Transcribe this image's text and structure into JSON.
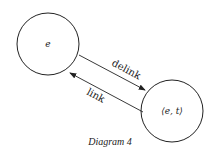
{
  "diagram": {
    "nodes": [
      {
        "id": "e",
        "label": "e"
      },
      {
        "id": "et",
        "label": "⟨e, t⟩"
      }
    ],
    "edges": [
      {
        "from": "e",
        "to": "et",
        "label": "delink"
      },
      {
        "from": "et",
        "to": "e",
        "label": "link"
      }
    ],
    "caption": "Diagram 4"
  }
}
